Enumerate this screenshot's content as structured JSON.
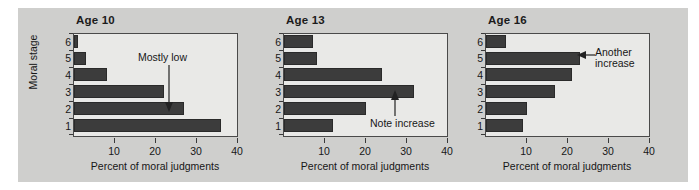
{
  "figure": {
    "background_color": "#cfcfcd",
    "plot_background_color": "#e9e9e7",
    "bar_color": "#3c3c3c",
    "axis_color": "#3a3a3a"
  },
  "common": {
    "ylabel": "Moral stage",
    "xlabel": "Percent of moral judgments",
    "xticks": [
      10,
      20,
      30,
      40
    ],
    "xtick_labels": [
      "10",
      "20",
      "30",
      "40"
    ],
    "ytick_labels": [
      "1",
      "2",
      "3",
      "4",
      "5",
      "6"
    ]
  },
  "chart_data": [
    {
      "type": "bar",
      "orientation": "horizontal",
      "title": "Age 10",
      "categories": [
        "1",
        "2",
        "3",
        "4",
        "5",
        "6"
      ],
      "values": [
        36,
        27,
        22,
        8,
        3,
        1
      ],
      "xlabel": "Percent of moral judgments",
      "ylabel": "Moral stage",
      "xlim": [
        0,
        40
      ],
      "grid": false,
      "annotations": [
        {
          "text": "Mostly low",
          "arrow": "down",
          "points_to_category": "1"
        }
      ]
    },
    {
      "type": "bar",
      "orientation": "horizontal",
      "title": "Age 13",
      "categories": [
        "1",
        "2",
        "3",
        "4",
        "5",
        "6"
      ],
      "values": [
        12,
        20,
        32,
        24,
        8,
        7
      ],
      "xlabel": "Percent of moral judgments",
      "ylabel": "Moral stage",
      "xlim": [
        0,
        40
      ],
      "grid": false,
      "annotations": [
        {
          "text": "Note increase",
          "arrow": "up",
          "points_to_category": "3"
        }
      ]
    },
    {
      "type": "bar",
      "orientation": "horizontal",
      "title": "Age 16",
      "categories": [
        "1",
        "2",
        "3",
        "4",
        "5",
        "6"
      ],
      "values": [
        9,
        10,
        17,
        21,
        23,
        5
      ],
      "xlabel": "Percent of moral judgments",
      "ylabel": "Moral stage",
      "xlim": [
        0,
        40
      ],
      "grid": false,
      "annotations": [
        {
          "text": "Another\nincrease",
          "arrow": "left",
          "points_to_category": "5"
        }
      ]
    }
  ]
}
